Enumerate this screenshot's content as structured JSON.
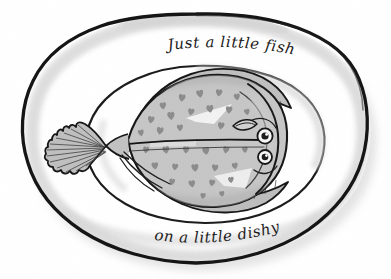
{
  "artwork": {
    "title": "Just a little fishy on a little dishy",
    "medium": "hand-drawn ink and grey watercolour wash illustration",
    "subject": "flatfish (flounder / plaice) served on an oval plate",
    "background_color": "#ffffff"
  },
  "captions": {
    "top": "Just a little fishy",
    "bottom": "on a little dishy"
  },
  "plate": {
    "name": "oval dish",
    "rim_label": "plate rim",
    "well_label": "plate well",
    "outline_color": "#151515",
    "rim_wash_color": "#d8d8d8",
    "shadow_color": "#cfcfcf",
    "fill_color": "#ffffff"
  },
  "fish": {
    "name": "flatfish",
    "body_color": "#c6c6c6",
    "body_shade_color": "#b0b0b0",
    "spot_color": "#8c8c8c",
    "fin_color": "#bdbdbd",
    "outline_color": "#161616",
    "highlight_color": "#f2f2f2",
    "parts": [
      "caudal fin",
      "caudal peduncle",
      "dorsal fin",
      "anal fin",
      "pectoral fin",
      "lateral line",
      "head",
      "upper eye",
      "lower eye",
      "mouth",
      "gill line",
      "body spots"
    ],
    "eye_count": 2,
    "spot_count": 33,
    "spot_shape": "heart"
  },
  "spots": [
    {
      "x": 163,
      "y": 106,
      "s": 5.4,
      "r": -6
    },
    {
      "x": 182,
      "y": 98,
      "s": 5.8,
      "r": 8
    },
    {
      "x": 200,
      "y": 94,
      "s": 6.0,
      "r": -10
    },
    {
      "x": 219,
      "y": 93,
      "s": 5.6,
      "r": 5
    },
    {
      "x": 237,
      "y": 97,
      "s": 5.2,
      "r": -8
    },
    {
      "x": 151,
      "y": 120,
      "s": 5.6,
      "r": 10
    },
    {
      "x": 171,
      "y": 116,
      "s": 6.2,
      "r": -4
    },
    {
      "x": 191,
      "y": 112,
      "s": 5.4,
      "r": 12
    },
    {
      "x": 210,
      "y": 109,
      "s": 6.0,
      "r": -7
    },
    {
      "x": 229,
      "y": 110,
      "s": 5.6,
      "r": 6
    },
    {
      "x": 247,
      "y": 112,
      "s": 4.8,
      "r": -12
    },
    {
      "x": 141,
      "y": 133,
      "s": 5.0,
      "r": -9
    },
    {
      "x": 160,
      "y": 131,
      "s": 5.8,
      "r": 7
    },
    {
      "x": 180,
      "y": 128,
      "s": 5.2,
      "r": -5
    },
    {
      "x": 221,
      "y": 126,
      "s": 5.6,
      "r": 9
    },
    {
      "x": 240,
      "y": 127,
      "s": 5.0,
      "r": -6
    },
    {
      "x": 146,
      "y": 150,
      "s": 5.2,
      "r": 8
    },
    {
      "x": 166,
      "y": 150,
      "s": 5.8,
      "r": -10
    },
    {
      "x": 186,
      "y": 150,
      "s": 5.4,
      "r": 4
    },
    {
      "x": 206,
      "y": 151,
      "s": 6.0,
      "r": -8
    },
    {
      "x": 226,
      "y": 150,
      "s": 5.4,
      "r": 11
    },
    {
      "x": 245,
      "y": 150,
      "s": 4.8,
      "r": -5
    },
    {
      "x": 155,
      "y": 166,
      "s": 5.6,
      "r": -7
    },
    {
      "x": 175,
      "y": 167,
      "s": 5.2,
      "r": 9
    },
    {
      "x": 195,
      "y": 168,
      "s": 6.0,
      "r": -4
    },
    {
      "x": 215,
      "y": 168,
      "s": 5.4,
      "r": 7
    },
    {
      "x": 235,
      "y": 166,
      "s": 5.0,
      "r": -11
    },
    {
      "x": 172,
      "y": 182,
      "s": 5.0,
      "r": 6
    },
    {
      "x": 192,
      "y": 184,
      "s": 5.6,
      "r": -8
    },
    {
      "x": 212,
      "y": 183,
      "s": 5.2,
      "r": 10
    },
    {
      "x": 231,
      "y": 180,
      "s": 4.8,
      "r": -6
    },
    {
      "x": 203,
      "y": 196,
      "s": 4.6,
      "r": 5
    },
    {
      "x": 222,
      "y": 194,
      "s": 4.4,
      "r": -9
    }
  ]
}
